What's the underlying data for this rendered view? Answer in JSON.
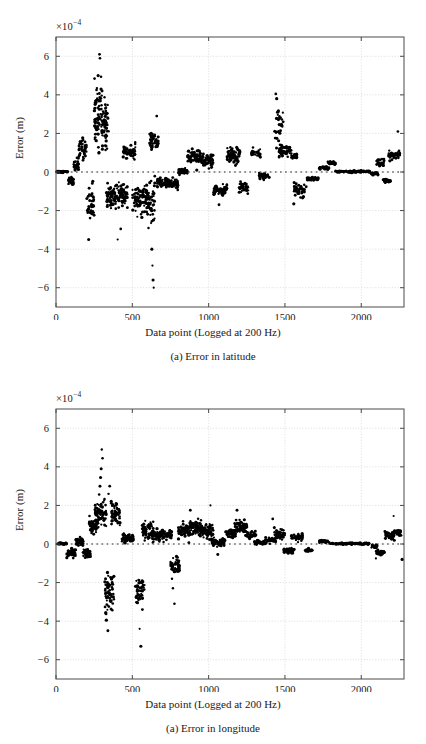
{
  "page": {
    "background": "#ffffff",
    "ink": "#1a1a1a",
    "grid_color": "#cfcfcf",
    "axis_color": "#4a4a4a",
    "marker_color": "#000000"
  },
  "figures": [
    {
      "id": "latitude",
      "caption": "(a) Error in latitude",
      "exponent_prefix": "×10",
      "exponent_power": "−4",
      "chart_data": {
        "type": "scatter",
        "title": "",
        "xlabel": "Data point (Logged at 200 Hz)",
        "ylabel": "Error (m)",
        "exponent": -4,
        "xlim": [
          0,
          2280
        ],
        "ylim": [
          -7,
          7
        ],
        "xticks": [
          0,
          500,
          1000,
          1500,
          2000
        ],
        "xticklabels": [
          "0",
          "500",
          "1000",
          "1500",
          "2000"
        ],
        "yticks": [
          -6,
          -4,
          -2,
          0,
          2,
          4,
          6
        ],
        "yticklabels": [
          "−6",
          "−4",
          "−2",
          "0",
          "2",
          "4",
          "6"
        ],
        "grid": true,
        "legend": "none",
        "zero_reference_line": true,
        "marker": "dot",
        "marker_size": 1.4,
        "clusters": [
          {
            "x0": 5,
            "x1": 80,
            "ymean": 0.02,
            "yspread": 0.04,
            "n": 40
          },
          {
            "x0": 80,
            "x1": 115,
            "ymean": -0.42,
            "yspread": 0.18,
            "n": 30
          },
          {
            "x0": 115,
            "x1": 150,
            "ymean": 0.35,
            "yspread": 0.25,
            "n": 28
          },
          {
            "x0": 150,
            "x1": 200,
            "ymean": 1.25,
            "yspread": 0.45,
            "n": 45
          },
          {
            "x0": 200,
            "x1": 250,
            "ymean": -1.7,
            "yspread": 0.85,
            "n": 40
          },
          {
            "x0": 250,
            "x1": 300,
            "ymean": 3.0,
            "yspread": 1.35,
            "n": 60
          },
          {
            "x0": 300,
            "x1": 345,
            "ymean": 2.35,
            "yspread": 1.1,
            "n": 55
          },
          {
            "x0": 330,
            "x1": 420,
            "ymean": -1.25,
            "yspread": 0.6,
            "n": 80
          },
          {
            "x0": 420,
            "x1": 470,
            "ymean": -1.2,
            "yspread": 0.55,
            "n": 45
          },
          {
            "x0": 440,
            "x1": 520,
            "ymean": 1.05,
            "yspread": 0.4,
            "n": 60
          },
          {
            "x0": 500,
            "x1": 600,
            "ymean": -1.45,
            "yspread": 0.7,
            "n": 75
          },
          {
            "x0": 590,
            "x1": 650,
            "ymean": -1.65,
            "yspread": 1.15,
            "n": 50
          },
          {
            "x0": 610,
            "x1": 670,
            "ymean": 1.65,
            "yspread": 0.4,
            "n": 45
          },
          {
            "x0": 660,
            "x1": 730,
            "ymean": -0.55,
            "yspread": 0.25,
            "n": 50
          },
          {
            "x0": 730,
            "x1": 800,
            "ymean": -0.6,
            "yspread": 0.22,
            "n": 48
          },
          {
            "x0": 800,
            "x1": 860,
            "ymean": 0.05,
            "yspread": 0.12,
            "n": 45
          },
          {
            "x0": 860,
            "x1": 960,
            "ymean": 0.8,
            "yspread": 0.35,
            "n": 70
          },
          {
            "x0": 960,
            "x1": 1030,
            "ymean": 0.6,
            "yspread": 0.35,
            "n": 50
          },
          {
            "x0": 1030,
            "x1": 1120,
            "ymean": -0.95,
            "yspread": 0.28,
            "n": 60
          },
          {
            "x0": 1120,
            "x1": 1210,
            "ymean": 0.85,
            "yspread": 0.38,
            "n": 65
          },
          {
            "x0": 1200,
            "x1": 1260,
            "ymean": -0.8,
            "yspread": 0.22,
            "n": 35
          },
          {
            "x0": 1280,
            "x1": 1340,
            "ymean": 0.95,
            "yspread": 0.18,
            "n": 30
          },
          {
            "x0": 1330,
            "x1": 1400,
            "ymean": -0.2,
            "yspread": 0.15,
            "n": 35
          },
          {
            "x0": 1430,
            "x1": 1490,
            "ymean": 2.4,
            "yspread": 0.95,
            "n": 30
          },
          {
            "x0": 1460,
            "x1": 1545,
            "ymean": 1.1,
            "yspread": 0.3,
            "n": 55
          },
          {
            "x0": 1540,
            "x1": 1580,
            "ymean": 0.8,
            "yspread": 0.15,
            "n": 22
          },
          {
            "x0": 1560,
            "x1": 1640,
            "ymean": -0.9,
            "yspread": 0.28,
            "n": 45
          },
          {
            "x0": 1640,
            "x1": 1720,
            "ymean": -0.35,
            "yspread": 0.1,
            "n": 35
          },
          {
            "x0": 1720,
            "x1": 1790,
            "ymean": 0.22,
            "yspread": 0.08,
            "n": 32
          },
          {
            "x0": 1780,
            "x1": 1830,
            "ymean": 0.48,
            "yspread": 0.1,
            "n": 25
          },
          {
            "x0": 1830,
            "x1": 2060,
            "ymean": 0.02,
            "yspread": 0.04,
            "n": 90
          },
          {
            "x0": 2060,
            "x1": 2110,
            "ymean": -0.08,
            "yspread": 0.08,
            "n": 22
          },
          {
            "x0": 2100,
            "x1": 2150,
            "ymean": 0.5,
            "yspread": 0.18,
            "n": 25
          },
          {
            "x0": 2140,
            "x1": 2190,
            "ymean": -0.45,
            "yspread": 0.12,
            "n": 25
          },
          {
            "x0": 2180,
            "x1": 2255,
            "ymean": 0.85,
            "yspread": 0.18,
            "n": 45
          }
        ],
        "outliers": [
          {
            "x": 285,
            "y": 6.1
          },
          {
            "x": 288,
            "y": 5.9
          },
          {
            "x": 276,
            "y": 5.0
          },
          {
            "x": 268,
            "y": 4.35
          },
          {
            "x": 295,
            "y": 4.3
          },
          {
            "x": 302,
            "y": 4.2
          },
          {
            "x": 262,
            "y": 3.6
          },
          {
            "x": 258,
            "y": 2.6
          },
          {
            "x": 640,
            "y": -6.0
          },
          {
            "x": 636,
            "y": -5.6
          },
          {
            "x": 632,
            "y": -4.85
          },
          {
            "x": 628,
            "y": -4.0
          },
          {
            "x": 214,
            "y": -3.5
          },
          {
            "x": 404,
            "y": -3.5
          },
          {
            "x": 424,
            "y": -2.95
          },
          {
            "x": 606,
            "y": -2.9
          },
          {
            "x": 1068,
            "y": -1.7
          },
          {
            "x": 1558,
            "y": -1.65
          },
          {
            "x": 660,
            "y": 2.9
          },
          {
            "x": 1452,
            "y": 3.1
          },
          {
            "x": 1440,
            "y": 4.05
          },
          {
            "x": 1446,
            "y": 3.8
          },
          {
            "x": 2240,
            "y": 2.1
          }
        ]
      }
    },
    {
      "id": "longitude",
      "caption": "(a) Error in longitude",
      "exponent_prefix": "×10",
      "exponent_power": "−4",
      "chart_data": {
        "type": "scatter",
        "title": "",
        "xlabel": "Data point (Logged at 200 Hz)",
        "ylabel": "Error (m)",
        "exponent": -4,
        "xlim": [
          0,
          2280
        ],
        "ylim": [
          -7,
          7
        ],
        "xticks": [
          0,
          500,
          1000,
          1500,
          2000
        ],
        "xticklabels": [
          "0",
          "500",
          "1000",
          "1500",
          "2000"
        ],
        "yticks": [
          -6,
          -4,
          -2,
          0,
          2,
          4,
          6
        ],
        "yticklabels": [
          "−6",
          "−4",
          "−2",
          "0",
          "2",
          "4",
          "6"
        ],
        "grid": true,
        "legend": "none",
        "zero_reference_line": true,
        "marker": "dot",
        "marker_size": 1.4,
        "clusters": [
          {
            "x0": 5,
            "x1": 70,
            "ymean": 0.02,
            "yspread": 0.04,
            "n": 35
          },
          {
            "x0": 70,
            "x1": 130,
            "ymean": -0.45,
            "yspread": 0.22,
            "n": 45
          },
          {
            "x0": 130,
            "x1": 180,
            "ymean": 0.12,
            "yspread": 0.22,
            "n": 40
          },
          {
            "x0": 175,
            "x1": 225,
            "ymean": -0.45,
            "yspread": 0.22,
            "n": 40
          },
          {
            "x0": 215,
            "x1": 265,
            "ymean": 0.9,
            "yspread": 0.45,
            "n": 45
          },
          {
            "x0": 255,
            "x1": 330,
            "ymean": 1.55,
            "yspread": 0.7,
            "n": 80
          },
          {
            "x0": 320,
            "x1": 380,
            "ymean": -2.55,
            "yspread": 0.85,
            "n": 65
          },
          {
            "x0": 360,
            "x1": 420,
            "ymean": 1.55,
            "yspread": 0.55,
            "n": 55
          },
          {
            "x0": 430,
            "x1": 510,
            "ymean": 0.28,
            "yspread": 0.2,
            "n": 55
          },
          {
            "x0": 520,
            "x1": 580,
            "ymean": -2.4,
            "yspread": 0.7,
            "n": 50
          },
          {
            "x0": 560,
            "x1": 640,
            "ymean": 0.7,
            "yspread": 0.4,
            "n": 60
          },
          {
            "x0": 630,
            "x1": 700,
            "ymean": 0.45,
            "yspread": 0.28,
            "n": 55
          },
          {
            "x0": 700,
            "x1": 760,
            "ymean": 0.5,
            "yspread": 0.22,
            "n": 40
          },
          {
            "x0": 750,
            "x1": 810,
            "ymean": -1.15,
            "yspread": 0.4,
            "n": 50
          },
          {
            "x0": 800,
            "x1": 880,
            "ymean": 0.7,
            "yspread": 0.3,
            "n": 60
          },
          {
            "x0": 870,
            "x1": 960,
            "ymean": 0.85,
            "yspread": 0.35,
            "n": 70
          },
          {
            "x0": 950,
            "x1": 1030,
            "ymean": 0.65,
            "yspread": 0.28,
            "n": 60
          },
          {
            "x0": 1020,
            "x1": 1110,
            "ymean": 0.08,
            "yspread": 0.15,
            "n": 60
          },
          {
            "x0": 1110,
            "x1": 1180,
            "ymean": 0.55,
            "yspread": 0.25,
            "n": 45
          },
          {
            "x0": 1170,
            "x1": 1250,
            "ymean": 0.85,
            "yspread": 0.38,
            "n": 65
          },
          {
            "x0": 1250,
            "x1": 1310,
            "ymean": 0.45,
            "yspread": 0.15,
            "n": 35
          },
          {
            "x0": 1300,
            "x1": 1370,
            "ymean": 0.08,
            "yspread": 0.1,
            "n": 35
          },
          {
            "x0": 1370,
            "x1": 1440,
            "ymean": 0.2,
            "yspread": 0.12,
            "n": 40
          },
          {
            "x0": 1430,
            "x1": 1500,
            "ymean": 0.48,
            "yspread": 0.22,
            "n": 45
          },
          {
            "x0": 1490,
            "x1": 1560,
            "ymean": -0.35,
            "yspread": 0.12,
            "n": 40
          },
          {
            "x0": 1540,
            "x1": 1620,
            "ymean": 0.35,
            "yspread": 0.18,
            "n": 45
          },
          {
            "x0": 1630,
            "x1": 1680,
            "ymean": -0.32,
            "yspread": 0.07,
            "n": 22
          },
          {
            "x0": 1720,
            "x1": 1790,
            "ymean": 0.12,
            "yspread": 0.06,
            "n": 30
          },
          {
            "x0": 1790,
            "x1": 2060,
            "ymean": 0.02,
            "yspread": 0.04,
            "n": 100
          },
          {
            "x0": 2060,
            "x1": 2110,
            "ymean": -0.12,
            "yspread": 0.08,
            "n": 22
          },
          {
            "x0": 2100,
            "x1": 2150,
            "ymean": -0.45,
            "yspread": 0.12,
            "n": 28
          },
          {
            "x0": 2150,
            "x1": 2220,
            "ymean": 0.45,
            "yspread": 0.2,
            "n": 40
          },
          {
            "x0": 2215,
            "x1": 2260,
            "ymean": 0.62,
            "yspread": 0.15,
            "n": 25
          }
        ],
        "outliers": [
          {
            "x": 300,
            "y": 4.9
          },
          {
            "x": 305,
            "y": 4.45
          },
          {
            "x": 296,
            "y": 3.9
          },
          {
            "x": 292,
            "y": 3.45
          },
          {
            "x": 288,
            "y": 3.0
          },
          {
            "x": 352,
            "y": 3.0
          },
          {
            "x": 344,
            "y": 2.6
          },
          {
            "x": 340,
            "y": -4.5
          },
          {
            "x": 330,
            "y": -3.95
          },
          {
            "x": 326,
            "y": -3.6
          },
          {
            "x": 556,
            "y": -5.3
          },
          {
            "x": 548,
            "y": -4.4
          },
          {
            "x": 566,
            "y": -3.4
          },
          {
            "x": 776,
            "y": -3.1
          },
          {
            "x": 766,
            "y": -2.3
          },
          {
            "x": 1012,
            "y": 2.0
          },
          {
            "x": 880,
            "y": 1.75
          },
          {
            "x": 1186,
            "y": 1.75
          },
          {
            "x": 1420,
            "y": 1.3
          },
          {
            "x": 2212,
            "y": 1.45
          },
          {
            "x": 2268,
            "y": -0.8
          },
          {
            "x": 1060,
            "y": -0.55
          },
          {
            "x": 2096,
            "y": -0.75
          }
        ]
      }
    }
  ]
}
